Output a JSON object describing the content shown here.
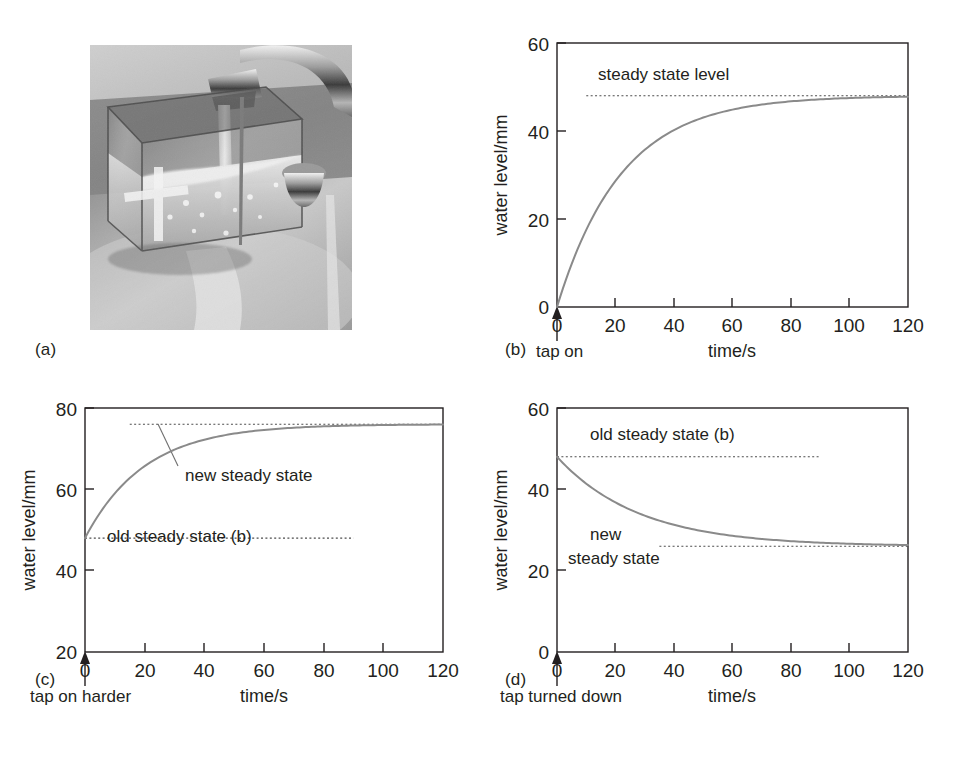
{
  "figure": {
    "panels": [
      {
        "id": "a",
        "label": "(a)"
      },
      {
        "id": "b",
        "label": "(b)"
      },
      {
        "id": "c",
        "label": "(c)"
      },
      {
        "id": "d",
        "label": "(d)"
      }
    ]
  },
  "photo": {
    "caption_label": "(a)",
    "description": "Transparent square tank with a hole, placed under a running kitchen tap, overflowing into a steel sink",
    "alt": "running-tap-over-tank-photo"
  },
  "chart_data": [
    {
      "panel": "b",
      "type": "line",
      "title": "",
      "xlabel": "time/s",
      "ylabel": "water level/mm",
      "xlim": [
        0,
        120
      ],
      "ylim": [
        0,
        60
      ],
      "xticks": [
        0,
        20,
        40,
        60,
        80,
        100,
        120
      ],
      "xticklabels": [
        "0",
        "20",
        "40",
        "60",
        "80",
        "100",
        "120"
      ],
      "yticks": [
        0,
        20,
        40,
        60
      ],
      "yticklabels": [
        "0",
        "20",
        "40",
        "60"
      ],
      "grid": false,
      "event_label": "tap on",
      "event_time": 0,
      "series": [
        {
          "name": "water level rising to steady state",
          "model": "48*(1-exp(-t/22))",
          "start_value": 0,
          "asymptote": 48,
          "time_constant_s": 22,
          "x": [
            0,
            5,
            10,
            15,
            20,
            25,
            30,
            35,
            40,
            45,
            50,
            60,
            70,
            80,
            90,
            100,
            110,
            120
          ],
          "y": [
            0,
            9.1,
            16.5,
            22.5,
            27.5,
            31.5,
            34.8,
            37.5,
            39.7,
            41.5,
            43.0,
            45.2,
            46.5,
            47.2,
            47.6,
            47.8,
            47.9,
            48.0
          ]
        }
      ],
      "reference_lines": [
        {
          "name": "steady state level",
          "label": "steady state level",
          "value": 48,
          "x_start": 10,
          "x_end": 120,
          "style": "dotted"
        }
      ],
      "annotations": [
        {
          "text": "steady state level",
          "value": 48,
          "x": 15,
          "y": 53
        }
      ]
    },
    {
      "panel": "c",
      "type": "line",
      "title": "",
      "xlabel": "time/s",
      "ylabel": "water level/mm",
      "xlim": [
        0,
        120
      ],
      "ylim": [
        20,
        80
      ],
      "xticks": [
        0,
        20,
        40,
        60,
        80,
        100,
        120
      ],
      "xticklabels": [
        "0",
        "20",
        "40",
        "60",
        "80",
        "100",
        "120"
      ],
      "yticks": [
        20,
        40,
        60,
        80
      ],
      "yticklabels": [
        "20",
        "40",
        "60",
        "80"
      ],
      "grid": false,
      "event_label": "tap on harder",
      "event_time": 0,
      "series": [
        {
          "name": "water level rising to new steady state",
          "model": "76-28*exp(-t/20)",
          "start_value": 48,
          "asymptote": 76,
          "time_constant_s": 20,
          "x": [
            0,
            5,
            10,
            15,
            20,
            25,
            30,
            35,
            40,
            50,
            60,
            70,
            80,
            90,
            100,
            110,
            120
          ],
          "y": [
            48.0,
            54.2,
            59.0,
            62.8,
            65.7,
            68.0,
            69.8,
            71.2,
            72.2,
            73.7,
            74.6,
            75.1,
            75.5,
            75.7,
            75.8,
            75.9,
            76.0
          ]
        }
      ],
      "reference_lines": [
        {
          "name": "new steady state",
          "label": "new steady state",
          "value": 76,
          "x_start": 15,
          "x_end": 120,
          "style": "dotted"
        },
        {
          "name": "old steady state (b)",
          "label": "old steady state (b)",
          "value": 48,
          "x_start": 0,
          "x_end": 90,
          "style": "dotted"
        }
      ],
      "annotations": [
        {
          "text": "new steady state",
          "value": 76,
          "x": 33,
          "y": 69
        },
        {
          "text": "old steady state (b)",
          "value": 48,
          "x": 13,
          "y": 52
        }
      ]
    },
    {
      "panel": "d",
      "type": "line",
      "title": "",
      "xlabel": "time/s",
      "ylabel": "water level/mm",
      "xlim": [
        0,
        120
      ],
      "ylim": [
        0,
        60
      ],
      "xticks": [
        0,
        20,
        40,
        60,
        80,
        100,
        120
      ],
      "xticklabels": [
        "0",
        "20",
        "40",
        "60",
        "80",
        "100",
        "120"
      ],
      "yticks": [
        0,
        20,
        40,
        60
      ],
      "yticklabels": [
        "0",
        "20",
        "40",
        "60"
      ],
      "grid": false,
      "event_label": "tap turned down",
      "event_time": 0,
      "series": [
        {
          "name": "water level falling to new steady state",
          "model": "26+22*exp(-t/28)",
          "start_value": 48,
          "asymptote": 26,
          "time_constant_s": 28,
          "x": [
            0,
            5,
            10,
            15,
            20,
            25,
            30,
            40,
            50,
            60,
            70,
            80,
            90,
            100,
            110,
            120
          ],
          "y": [
            48.0,
            44.4,
            41.5,
            39.0,
            36.9,
            35.1,
            33.7,
            31.4,
            29.8,
            28.7,
            27.9,
            27.3,
            26.9,
            26.6,
            26.4,
            26.3
          ]
        }
      ],
      "reference_lines": [
        {
          "name": "old steady state (b)",
          "label": "old steady state (b)",
          "value": 48,
          "x_start": 0,
          "x_end": 90,
          "style": "dotted"
        },
        {
          "name": "new steady state",
          "label": "new steady state",
          "value": 26,
          "x_start": 35,
          "x_end": 120,
          "style": "dotted"
        }
      ],
      "annotations": [
        {
          "text": "old steady state (b)",
          "value": 48,
          "x": 10,
          "y": 54
        },
        {
          "text": "new",
          "value": 26,
          "x": 13,
          "y": 29
        },
        {
          "text": "steady state",
          "value": 26,
          "x": 7,
          "y": 21
        }
      ]
    }
  ],
  "labels": {
    "b": {
      "ylabel": "water level/mm",
      "xlabel": "time/s",
      "event": "tap on",
      "steady": "steady state level",
      "y0": "0",
      "y1": "20",
      "y2": "40",
      "y3": "60",
      "x0": "0",
      "x1": "20",
      "x2": "40",
      "x3": "60",
      "x4": "80",
      "x5": "100",
      "x6": "120"
    },
    "c": {
      "ylabel": "water level/mm",
      "xlabel": "time/s",
      "event": "tap on harder",
      "new_steady": "new steady state",
      "old_steady": "old steady state (b)",
      "y0": "20",
      "y1": "40",
      "y2": "60",
      "y3": "80",
      "x0": "0",
      "x1": "20",
      "x2": "40",
      "x3": "60",
      "x4": "80",
      "x5": "100",
      "x6": "120"
    },
    "d": {
      "ylabel": "water level/mm",
      "xlabel": "time/s",
      "event": "tap turned down",
      "old_steady": "old steady state (b)",
      "new_line1": "new",
      "new_line2": "steady state",
      "y0": "0",
      "y1": "20",
      "y2": "40",
      "y3": "60",
      "x0": "0",
      "x1": "20",
      "x2": "40",
      "x3": "60",
      "x4": "80",
      "x5": "100",
      "x6": "120"
    }
  },
  "colors": {
    "ink": "#231f20",
    "curve": "#8a8a8a",
    "dotted": "#4d4d4d",
    "background": "#ffffff"
  }
}
